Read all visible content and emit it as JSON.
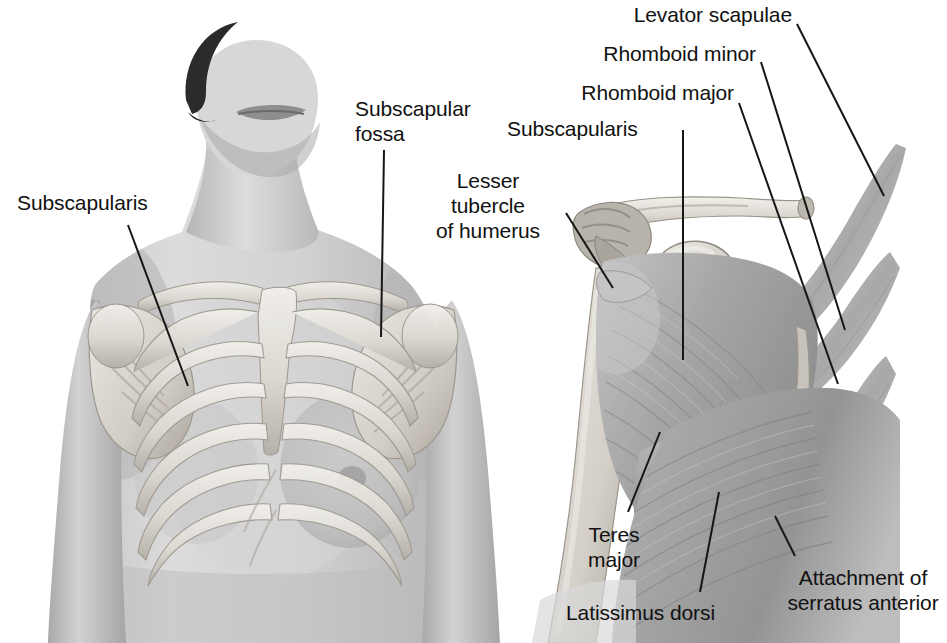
{
  "figure": {
    "background_color": "#ffffff",
    "text_color": "#111111",
    "leader_color": "#161616",
    "panels": [
      {
        "name": "anterior-torso-with-skeleton",
        "description": "Anterior view of female torso with ribcage, clavicles and scapulae overlaid"
      },
      {
        "name": "anterior-scapula-dissection",
        "description": "Anterior view of right scapula showing subscapularis, humerus, and posterior attachments"
      }
    ]
  },
  "labels": {
    "subscapularis_left": {
      "text": "Subscapularis",
      "align": "left"
    },
    "subscapular_fossa": {
      "text": "Subscapular\nfossa",
      "align": "left"
    },
    "subscapularis_right": {
      "text": "Subscapularis",
      "align": "left"
    },
    "lesser_tubercle": {
      "text": "Lesser\ntubercle\nof humerus",
      "align": "center"
    },
    "levator_scapulae": {
      "text": "Levator scapulae",
      "align": "right"
    },
    "rhomboid_minor": {
      "text": "Rhomboid minor",
      "align": "right"
    },
    "rhomboid_major": {
      "text": "Rhomboid major",
      "align": "right"
    },
    "teres_major": {
      "text": "Teres\nmajor",
      "align": "center"
    },
    "latissimus_dorsi": {
      "text": "Latissimus dorsi",
      "align": "left"
    },
    "serratus_anterior": {
      "text": "Attachment of\nserratus anterior",
      "align": "center"
    }
  },
  "palette": {
    "skin_light": "#d9d9d9",
    "skin_mid": "#bfbfbf",
    "skin_dark": "#9a9a9a",
    "bone_light": "#eceae6",
    "bone_mid": "#cfcbc4",
    "bone_dark": "#a9a49c",
    "muscle_light": "#cfcfcf",
    "muscle_mid": "#ababab",
    "muscle_dark": "#8a8a8a",
    "hair_dark": "#2a2a2a"
  }
}
